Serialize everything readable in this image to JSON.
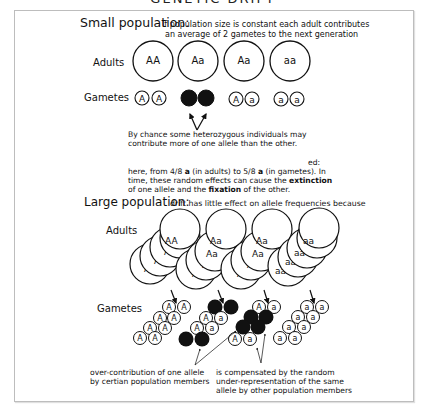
{
  "figure": {
    "title": "GENETIC DRIFT"
  },
  "small_population": {
    "heading": "Small population:",
    "description_line1": "If population size is constant each adult contributes",
    "description_line2": "an average of 2 gametes to the next generation",
    "adults_label": "Adults",
    "gametes_label": "Gametes",
    "adults": [
      "AA",
      "Aa",
      "Aa",
      "aa"
    ],
    "gametes": [
      [
        "A",
        "A"
      ],
      [
        "",
        ""
      ],
      [
        "A",
        "a"
      ],
      [
        "a",
        "a"
      ]
    ],
    "note_line1": "By chance some heterozygous individuals may",
    "note_line2": "contribute more of one allele than the other.",
    "explanation_suffix": "ed:",
    "explanation_line1": "here, from 4/8 a (in adults) to 5/8 a (in gametes).  In",
    "explanation_line2_pre": "time, these random effects can cause the ",
    "explanation_line2_bold": "extinction",
    "explanation_line3_pre": "of one allele and the ",
    "explanation_line3_bold": "fixation",
    "explanation_line3_post": " of the other.",
    "exp1_a": "here, from 4/8 ",
    "exp1_b": "a",
    "exp1_c": " (in adults) to 5/8 ",
    "exp1_d": "a",
    "exp1_e": " (in gametes).  In"
  },
  "large_population": {
    "heading": "Large population:",
    "description": "drift has little effect on allele frequencies because",
    "adults_label": "Adults",
    "gametes_label": "Gametes",
    "adult_groups": [
      "AA",
      "Aa",
      "Aa",
      "aa"
    ],
    "note_left_line1": "over-contribution of one allele",
    "note_left_line2": "by certian population members",
    "note_right_line1": "is compensated by the random",
    "note_right_line2": "under-representation of the same",
    "note_right_line3": "allele by other population members"
  },
  "colors": {
    "ink": "#111111",
    "frame": "#bdbdbd",
    "background": "#ffffff"
  }
}
